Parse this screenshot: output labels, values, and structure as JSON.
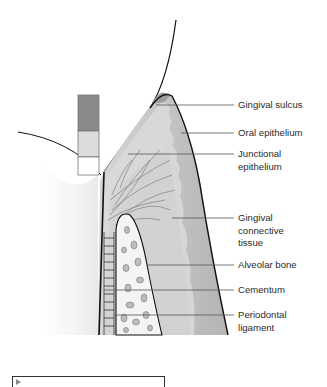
{
  "figure": {
    "labels": [
      {
        "id": "gingival-sulcus",
        "text": "Gingival sulcus",
        "y": 100
      },
      {
        "id": "oral-epithelium",
        "text": "Oral epithelium",
        "y": 128
      },
      {
        "id": "junctional-epithelium",
        "text": "Junctional\nepithelium",
        "y": 148
      },
      {
        "id": "gingival-connective-tissue",
        "text": "Gingival\nconnective\ntissue",
        "y": 213
      },
      {
        "id": "alveolar-bone",
        "text": "Alveolar bone",
        "y": 259
      },
      {
        "id": "cementum",
        "text": "Cementum",
        "y": 284
      },
      {
        "id": "periodontal-ligament",
        "text": "Periodontal\nligament",
        "y": 309
      }
    ],
    "legend_bar": {
      "top_color": "#8a8a8a",
      "middle_color": "#dcdcdc",
      "bottom_color": "#ffffff"
    },
    "colors": {
      "outline": "#111111",
      "gingiva_fill": "#c4c4c4",
      "epithelium_fill": "#dadada",
      "bone_fill": "#f4f4f4",
      "bone_pores": "#bdbdbd",
      "leader_line": "#555555",
      "label_text": "#2a2a2a"
    }
  }
}
